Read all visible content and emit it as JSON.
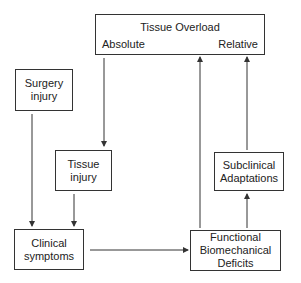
{
  "diagram": {
    "nodes": {
      "tissue_overload": {
        "title": "Tissue Overload",
        "left_label": "Absolute",
        "right_label": "Relative"
      },
      "surgery_injury": {
        "lines": [
          "Surgery",
          "injury"
        ]
      },
      "tissue_injury": {
        "lines": [
          "Tissue",
          "injury"
        ]
      },
      "clinical_symptoms": {
        "lines": [
          "Clinical",
          "symptoms"
        ]
      },
      "subclinical_adaptations": {
        "lines": [
          "Subclinical",
          "Adaptations"
        ]
      },
      "functional_deficits": {
        "lines": [
          "Functional",
          "Biomechanical",
          "Deficits"
        ]
      }
    },
    "edges": [
      {
        "from": "Tissue Overload (Absolute)",
        "to": "Tissue injury"
      },
      {
        "from": "Surgery injury",
        "to": "Clinical symptoms"
      },
      {
        "from": "Tissue injury",
        "to": "Clinical symptoms"
      },
      {
        "from": "Clinical symptoms",
        "to": "Functional Biomechanical Deficits"
      },
      {
        "from": "Functional Biomechanical Deficits",
        "to": "Tissue Overload"
      },
      {
        "from": "Functional Biomechanical Deficits",
        "to": "Subclinical Adaptations"
      },
      {
        "from": "Subclinical Adaptations",
        "to": "Tissue Overload (Relative)"
      }
    ],
    "colors": {
      "stroke": "#333333",
      "text": "#222222",
      "background": "#ffffff"
    }
  }
}
